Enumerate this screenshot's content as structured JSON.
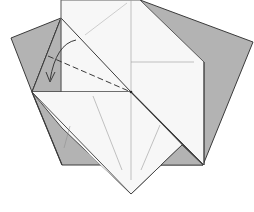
{
  "diagram": {
    "type": "origami-fold-step",
    "colors": {
      "background": "#ffffff",
      "paper_white": "#f7f7f7",
      "paper_gray": "#b3b3b3",
      "edge": "#3a3a3a",
      "crease": "#9a9a9a",
      "valley_fold": "#3a3a3a",
      "arrow": "#3a3a3a"
    },
    "annotations": {
      "fold_arrow": "curved arrow indicating fold down-left",
      "valley_fold_line": "dashed valley-fold line"
    }
  }
}
